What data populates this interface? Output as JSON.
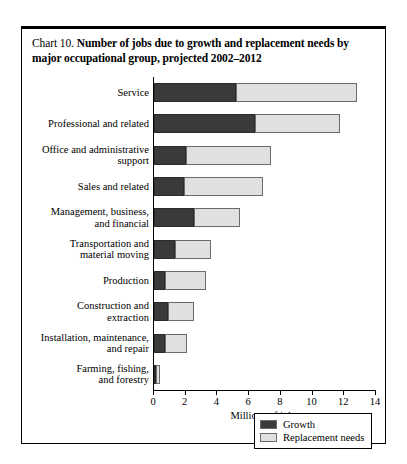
{
  "figure": {
    "label_lead": "Chart 10.",
    "title": "Number of jobs due to growth and replacement needs by major occupational group, projected 2002–2012"
  },
  "axis": {
    "x_title": "Millions of jobs",
    "x_ticks": [
      "0",
      "2",
      "4",
      "6",
      "8",
      "10",
      "12",
      "14"
    ]
  },
  "legend": {
    "items": [
      {
        "label": "Growth",
        "color": "#3a3a3a"
      },
      {
        "label": "Replacement needs",
        "color": "#e0e0e0"
      }
    ]
  },
  "colors": {
    "growth": "#3a3a3a",
    "replacement": "#e0e0e0",
    "frame": "#000000",
    "background": "#ffffff"
  },
  "chart_data": {
    "type": "bar",
    "orientation": "horizontal",
    "stacked": true,
    "title": "Chart 10. Number of jobs due to growth and replacement needs by major occupational group, projected 2002–2012",
    "xlabel": "Millions of jobs",
    "ylabel": "",
    "xlim": [
      0,
      14
    ],
    "xticks": [
      0,
      2,
      4,
      6,
      8,
      10,
      12,
      14
    ],
    "grid": false,
    "legend_position": "bottom-right",
    "categories": [
      "Service",
      "Professional and related",
      "Office and administrative support",
      "Sales and related",
      "Management, business, and financial",
      "Transportation and material moving",
      "Production",
      "Construction and extraction",
      "Installation, maintenance, and repair",
      "Farming, fishing, and forestry"
    ],
    "series": [
      {
        "name": "Growth",
        "color": "#3a3a3a",
        "values": [
          5.2,
          6.4,
          2.0,
          1.9,
          2.5,
          1.3,
          0.7,
          0.9,
          0.7,
          0.1
        ]
      },
      {
        "name": "Replacement needs",
        "color": "#e0e0e0",
        "values": [
          7.6,
          5.3,
          5.4,
          5.0,
          2.9,
          2.3,
          2.6,
          1.6,
          1.4,
          0.25
        ]
      }
    ],
    "totals": [
      12.8,
      11.7,
      7.4,
      6.9,
      5.4,
      3.6,
      3.3,
      2.5,
      2.1,
      0.35
    ]
  },
  "category_label_lines": [
    [
      "Service"
    ],
    [
      "Professional and related"
    ],
    [
      "Office and administrative",
      "support"
    ],
    [
      "Sales and related"
    ],
    [
      "Management, business,",
      "and financial"
    ],
    [
      "Transportation and",
      "material moving"
    ],
    [
      "Production"
    ],
    [
      "Construction and",
      "extraction"
    ],
    [
      "Installation, maintenance,",
      "and repair"
    ],
    [
      "Farming, fishing,",
      "and forestry"
    ]
  ]
}
